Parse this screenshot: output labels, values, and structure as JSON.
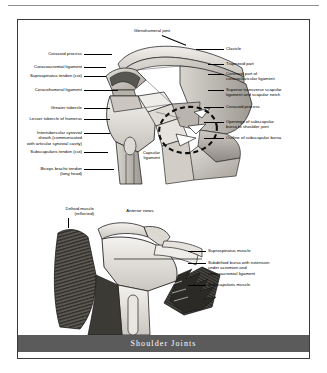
{
  "figure": {
    "title": "Shoulder Joints",
    "panels": [
      {
        "id": "upper",
        "name": "coronal-section-view",
        "center_labels": [
          {
            "id": "glenohumeral-joint",
            "text": "Glenohumeral joint"
          },
          {
            "id": "capsular-ligament",
            "text": "Capsular\nligament"
          }
        ],
        "left_labels": [
          {
            "id": "coracoid-process",
            "text": "Coracoid process"
          },
          {
            "id": "coracoacromial-ligament",
            "text": "Coracoacromial ligament"
          },
          {
            "id": "supraspinatus-tendon-cut",
            "text": "Supraspinatus tendon (cut)"
          },
          {
            "id": "coracohumeral-ligament",
            "text": "Coracohumeral ligament"
          },
          {
            "id": "greater-tubercle",
            "text": "Greater tubercle"
          },
          {
            "id": "lesser-tubercle-of-humerus",
            "text": "Lesser tubercle of humerus"
          },
          {
            "id": "intertubercular-synovial-sheath",
            "text": "Intertubercular synovial\nsheath (communicated\nwith articular synovial cavity)"
          },
          {
            "id": "subscapularis-tendon-cut",
            "text": "Subscapularis tendon (cut)"
          },
          {
            "id": "biceps-brachii-tendon",
            "text": "Biceps brachii tendon\n(long head)"
          }
        ],
        "right_labels": [
          {
            "id": "clavicle",
            "text": "Clavicle"
          },
          {
            "id": "trapezoid-part",
            "text": "Trapezoid part"
          },
          {
            "id": "coronoid-part-coracoclavicular-ligament",
            "text": "Coronoid part of\ncoracoclavicular ligament"
          },
          {
            "id": "superior-transverse-scapular-ligament",
            "text": "Superior transverse scapular\nligament and scapular notch"
          },
          {
            "id": "coracoid-process-right",
            "text": "Coracoid process"
          },
          {
            "id": "openings-of-subscapular-bursa",
            "text": "Openings of subscapular\nbursa to shoulder joint"
          },
          {
            "id": "outline-of-subscapular-bursa",
            "text": "Outline of subscapular bursa"
          }
        ]
      },
      {
        "id": "lower",
        "name": "anterior-views",
        "center_labels": [
          {
            "id": "anterior-views",
            "text": "Anterior views"
          }
        ],
        "left_labels": [
          {
            "id": "deltoid-muscle-reflected",
            "text": "Deltoid muscle\n(reflected)"
          }
        ],
        "right_labels": [
          {
            "id": "supraspinatus-muscle",
            "text": "Supraspinatus muscle"
          },
          {
            "id": "subdeltoid-bursa",
            "text": "Subdeltoid bursa with extension\nunder acromion and\ncoracoacromial ligament"
          },
          {
            "id": "subscapularis-muscle",
            "text": "Subscapularis muscle"
          }
        ]
      }
    ]
  },
  "colors": {
    "title_bar": "#5b5b5b",
    "title_text": "#ffffff",
    "frame_border": "#3a3a3a",
    "label_text": "#000000",
    "bone_light": "#e8e6e2",
    "bone_mid": "#c9c6c0",
    "bone_dark": "#9b978f",
    "muscle_dark": "#4a4843",
    "outline": "#1a1a1a"
  }
}
